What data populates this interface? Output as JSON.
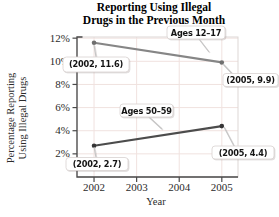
{
  "chart_data": {
    "type": "line",
    "title": "Reporting Using Illegal Drugs in the Previous Month",
    "title_line1": "Reporting Using Illegal",
    "title_line2": "Drugs in the Previous Month",
    "xlabel": "Year",
    "ylabel": "Percentage Reporting Using Illegal Drugs",
    "ylabel_line1": "Percentage Reporting",
    "ylabel_line2": "Using Illegal Drugs",
    "x_tick_labels": [
      "2002",
      "2003",
      "2004",
      "2005"
    ],
    "x_tick_values": [
      2002,
      2003,
      2004,
      2005
    ],
    "y_tick_labels": [
      "2%",
      "4%",
      "6%",
      "8%",
      "10%",
      "12%"
    ],
    "y_tick_values": [
      2,
      4,
      6,
      8,
      10,
      12
    ],
    "xlim": [
      2001.6,
      2005.38
    ],
    "ylim": [
      0,
      12.1
    ],
    "grid": true,
    "legend_position": "inline-callouts",
    "series": [
      {
        "name": "Ages 12–17",
        "x": [
          2002,
          2005
        ],
        "values": [
          11.6,
          9.9
        ],
        "color": "#868686",
        "point_color": "#6f6f6f"
      },
      {
        "name": "Ages 50–59",
        "x": [
          2002,
          2005
        ],
        "values": [
          2.7,
          4.4
        ],
        "color": "#4c4c4c",
        "point_color": "#353535"
      }
    ],
    "annotations": [
      {
        "text": "Ages 12–17",
        "points_to": "series Ages 12–17"
      },
      {
        "text": "(2002, 11.6)",
        "points_to": "point 2002,11.6"
      },
      {
        "text": "(2005, 9.9)",
        "points_to": "point 2005,9.9"
      },
      {
        "text": "Ages 50–59",
        "points_to": "series Ages 50–59"
      },
      {
        "text": "(2002, 2.7)",
        "points_to": "point 2002,2.7"
      },
      {
        "text": "(2005, 4.4)",
        "points_to": "point 2005,4.4"
      }
    ],
    "colors": {
      "grid": "#f0e2df",
      "axis": "#4a4a4a",
      "frame": "#ddd7d5",
      "tick_label": "#2b2b2b",
      "callout_bg": "#ffffff",
      "callout_border": "#d8d2d0",
      "callout_text": "#141414",
      "leader": "#c6c6c6",
      "background": "#ffffff"
    }
  }
}
